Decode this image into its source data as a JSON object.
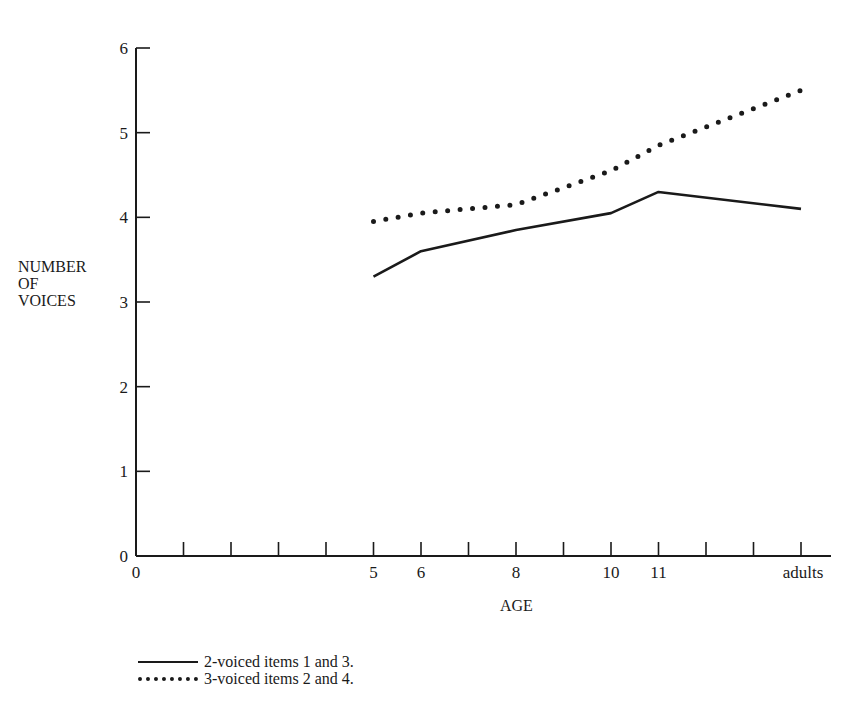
{
  "chart_data": {
    "type": "line",
    "title": "",
    "xlabel": "AGE",
    "ylabel": "NUMBER OF VOICES",
    "ylabel_lines": [
      "NUMBER",
      "OF",
      "VOICES"
    ],
    "ylim": [
      0,
      6
    ],
    "yticks": [
      "0",
      "1",
      "2",
      "3",
      "4",
      "5",
      "6"
    ],
    "x_tick_positions": 14,
    "xtick_labels": [
      {
        "pos": 0,
        "label": "0"
      },
      {
        "pos": 5,
        "label": "5"
      },
      {
        "pos": 6,
        "label": "6"
      },
      {
        "pos": 8,
        "label": "8"
      },
      {
        "pos": 10,
        "label": "10"
      },
      {
        "pos": 11,
        "label": "11"
      },
      {
        "pos": 14,
        "label": "adults"
      }
    ],
    "categories": [
      "5",
      "6",
      "8",
      "10",
      "11",
      "adults"
    ],
    "category_positions": [
      5,
      6,
      8,
      10,
      11,
      14
    ],
    "series": [
      {
        "name": "2-voiced items 1 and 3.",
        "style": "solid",
        "values": [
          3.3,
          3.6,
          3.85,
          4.05,
          4.3,
          4.1
        ]
      },
      {
        "name": "3-voiced items 2 and 4.",
        "style": "dotted",
        "values": [
          3.95,
          4.05,
          4.15,
          4.55,
          4.85,
          5.5
        ]
      }
    ],
    "grid": false,
    "legend_position": "bottom-left"
  },
  "legend": {
    "items": [
      {
        "label": "2-voiced items 1 and 3.",
        "style": "solid"
      },
      {
        "label": "3-voiced items 2 and 4.",
        "style": "dotted"
      }
    ]
  }
}
